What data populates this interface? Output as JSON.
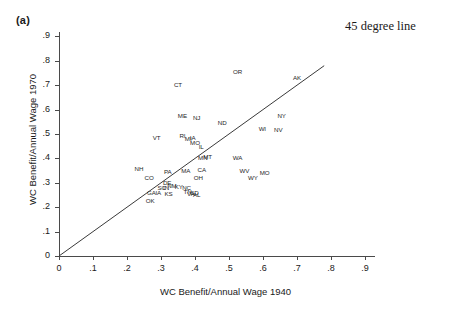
{
  "figure": {
    "panel_label": "(a)",
    "annotation": "45 degree line"
  },
  "chart_data": {
    "type": "scatter",
    "title": "(a)",
    "xlabel": "WC Benefit/Annual Wage 1940",
    "ylabel": "WC Benefit/Annual Wage 1970",
    "xlim": [
      -0.03,
      0.95
    ],
    "ylim": [
      -0.03,
      0.95
    ],
    "xticks": [
      0,
      0.1,
      0.2,
      0.3,
      0.4,
      0.5,
      0.6,
      0.7,
      0.8,
      0.9
    ],
    "xticklabels": [
      "0",
      ".1",
      ".2",
      ".3",
      ".4",
      ".5",
      ".6",
      ".7",
      ".8",
      ".9"
    ],
    "yticks": [
      0,
      0.1,
      0.2,
      0.3,
      0.4,
      0.5,
      0.6,
      0.7,
      0.8,
      0.9
    ],
    "yticklabels": [
      "0",
      ".1",
      ".2",
      ".3",
      ".4",
      ".5",
      ".6",
      ".7",
      ".8",
      ".9"
    ],
    "grid": false,
    "legend": false,
    "annotations": [
      {
        "text": "45 degree line",
        "x": 0.855,
        "y": 0.935
      }
    ],
    "reference_line": {
      "type": "identity",
      "label": "45 degree line",
      "from": [
        0,
        0
      ],
      "to": [
        0.78,
        0.78
      ],
      "color": "#3a3a3a"
    },
    "point_label_field": "state",
    "points": [
      {
        "state": "OR",
        "x": 0.525,
        "y": 0.755
      },
      {
        "state": "CT",
        "x": 0.35,
        "y": 0.7
      },
      {
        "state": "AK",
        "x": 0.7,
        "y": 0.73
      },
      {
        "state": "NY",
        "x": 0.655,
        "y": 0.575
      },
      {
        "state": "ME",
        "x": 0.363,
        "y": 0.572
      },
      {
        "state": "NJ",
        "x": 0.405,
        "y": 0.565
      },
      {
        "state": "ND",
        "x": 0.48,
        "y": 0.545
      },
      {
        "state": "WI",
        "x": 0.598,
        "y": 0.52
      },
      {
        "state": "NV",
        "x": 0.645,
        "y": 0.518
      },
      {
        "state": "VT",
        "x": 0.287,
        "y": 0.485
      },
      {
        "state": "RI",
        "x": 0.363,
        "y": 0.49
      },
      {
        "state": "MI",
        "x": 0.38,
        "y": 0.478
      },
      {
        "state": "IA",
        "x": 0.393,
        "y": 0.483
      },
      {
        "state": "MO",
        "x": 0.4,
        "y": 0.462
      },
      {
        "state": "IL",
        "x": 0.418,
        "y": 0.448
      },
      {
        "state": "MN",
        "x": 0.423,
        "y": 0.4
      },
      {
        "state": "MT",
        "x": 0.437,
        "y": 0.405
      },
      {
        "state": "WA",
        "x": 0.525,
        "y": 0.4
      },
      {
        "state": "NH",
        "x": 0.235,
        "y": 0.355
      },
      {
        "state": "PA",
        "x": 0.32,
        "y": 0.345
      },
      {
        "state": "MA",
        "x": 0.373,
        "y": 0.35
      },
      {
        "state": "CA",
        "x": 0.42,
        "y": 0.352
      },
      {
        "state": "WV",
        "x": 0.545,
        "y": 0.348
      },
      {
        "state": "MO2",
        "x": 0.605,
        "y": 0.34
      },
      {
        "state": "CO",
        "x": 0.265,
        "y": 0.32
      },
      {
        "state": "OH",
        "x": 0.41,
        "y": 0.32
      },
      {
        "state": "WY",
        "x": 0.57,
        "y": 0.32
      },
      {
        "state": "DE",
        "x": 0.318,
        "y": 0.3
      },
      {
        "state": "SC",
        "x": 0.302,
        "y": 0.278
      },
      {
        "state": "IN",
        "x": 0.315,
        "y": 0.28
      },
      {
        "state": "NM",
        "x": 0.332,
        "y": 0.285
      },
      {
        "state": "KY",
        "x": 0.352,
        "y": 0.282
      },
      {
        "state": "NC",
        "x": 0.375,
        "y": 0.28
      },
      {
        "state": "GA",
        "x": 0.272,
        "y": 0.258
      },
      {
        "state": "IA2",
        "x": 0.292,
        "y": 0.258
      },
      {
        "state": "KS",
        "x": 0.322,
        "y": 0.255
      },
      {
        "state": "TN",
        "x": 0.378,
        "y": 0.262
      },
      {
        "state": "VA",
        "x": 0.388,
        "y": 0.255
      },
      {
        "state": "SD",
        "x": 0.398,
        "y": 0.258
      },
      {
        "state": "AL",
        "x": 0.405,
        "y": 0.252
      },
      {
        "state": "OK",
        "x": 0.268,
        "y": 0.225
      }
    ]
  }
}
